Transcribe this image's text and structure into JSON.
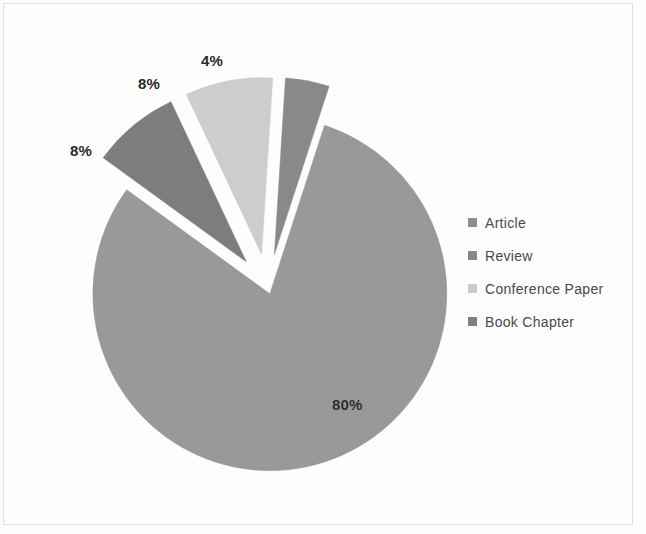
{
  "chart_data": {
    "type": "pie",
    "title": "",
    "labels": [
      "Article",
      "Review",
      "Conference Paper",
      "Book Chapter"
    ],
    "values": [
      80,
      8,
      8,
      4
    ],
    "value_labels": [
      "80%",
      "8%",
      "8%",
      "4%"
    ],
    "units": "percent",
    "exploded": true,
    "legend_position": "right",
    "grid": false,
    "colors": [
      "#9a9a9a",
      "#7e7e7e",
      "#cfcfcf",
      "#8a8a8a"
    ],
    "slices": [
      {
        "name": "Article",
        "value": 80,
        "value_label": "80%",
        "color": "#9a9a9a",
        "start_angle_deg": 18,
        "end_angle_deg": 306,
        "explode_offset_px": 6
      },
      {
        "name": "Review",
        "value": 8,
        "value_label": "8%",
        "color": "#7e7e7e",
        "start_angle_deg": 306,
        "end_angle_deg": 334.8,
        "explode_offset_px": 34
      },
      {
        "name": "Conference Paper",
        "value": 8,
        "value_label": "8%",
        "color": "#cfcfcf",
        "start_angle_deg": 334.8,
        "end_angle_deg": 363.6,
        "explode_offset_px": 34
      },
      {
        "name": "Book Chapter",
        "value": 4,
        "value_label": "4%",
        "color": "#8a8a8a",
        "start_angle_deg": 363.6,
        "end_angle_deg": 378,
        "explode_offset_px": 34
      }
    ]
  },
  "legend": {
    "items": [
      {
        "label": "Article",
        "color": "#8f8f8f"
      },
      {
        "label": "Review",
        "color": "#898989"
      },
      {
        "label": "Conference Paper",
        "color": "#cccccc"
      },
      {
        "label": "Book Chapter",
        "color": "#808080"
      }
    ]
  },
  "labels_on_chart": {
    "article": "80%",
    "review": "8%",
    "conference_paper": "8%",
    "book_chapter": "4%"
  },
  "style": {
    "background": "#ffffff",
    "frame_color": "#e2e2e2",
    "label_color": "#2c2c2c",
    "legend_text_color": "#4a4a4a"
  }
}
